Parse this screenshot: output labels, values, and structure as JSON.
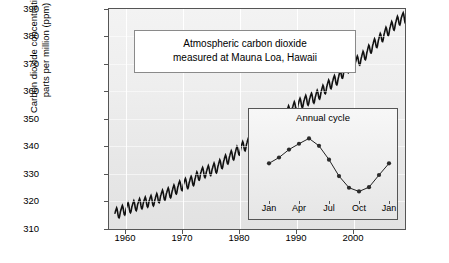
{
  "chart_data": {
    "type": "line",
    "title": "",
    "annotation": "Atmospheric carbon dioxide\nmeasured at Mauna Loa, Hawaii",
    "ylabel": "Carbon dioxide concentration,\nparts per million (ppm)",
    "xlabel": "",
    "ylim": [
      310,
      390
    ],
    "xlim": [
      1957,
      2009
    ],
    "yticks": [
      310,
      320,
      330,
      340,
      350,
      360,
      370,
      380,
      390
    ],
    "xticks": [
      1960,
      1970,
      1980,
      1990,
      2000
    ],
    "grid": true,
    "legend": null,
    "series": [
      {
        "name": "Mauna Loa monthly mean CO2 (ppm)",
        "x": [
          1958,
          1959,
          1960,
          1961,
          1962,
          1963,
          1964,
          1965,
          1966,
          1967,
          1968,
          1969,
          1970,
          1971,
          1972,
          1973,
          1974,
          1975,
          1976,
          1977,
          1978,
          1979,
          1980,
          1981,
          1982,
          1983,
          1984,
          1985,
          1986,
          1987,
          1988,
          1989,
          1990,
          1991,
          1992,
          1993,
          1994,
          1995,
          1996,
          1997,
          1998,
          1999,
          2000,
          2001,
          2002,
          2003,
          2004,
          2005,
          2006,
          2007,
          2008
        ],
        "values": [
          315.0,
          315.8,
          316.9,
          317.6,
          318.4,
          319.0,
          319.6,
          320.0,
          321.4,
          322.2,
          323.0,
          324.6,
          325.7,
          326.3,
          327.5,
          329.7,
          330.2,
          331.1,
          332.0,
          333.8,
          335.4,
          336.8,
          338.7,
          340.1,
          341.4,
          343.0,
          344.6,
          346.0,
          347.4,
          349.2,
          351.6,
          353.1,
          354.4,
          355.6,
          356.4,
          357.1,
          358.8,
          360.8,
          362.6,
          363.8,
          366.6,
          368.3,
          369.5,
          371.0,
          373.1,
          375.6,
          377.4,
          379.7,
          381.8,
          383.7,
          385.6
        ]
      }
    ],
    "inset": {
      "title": "Annual cycle",
      "type": "line",
      "xticks": [
        "Jan",
        "Apr",
        "Jul",
        "Oct",
        "Jan"
      ],
      "categories": [
        "Jan",
        "Feb",
        "Mar",
        "Apr",
        "May",
        "Jun",
        "Jul",
        "Aug",
        "Sep",
        "Oct",
        "Nov",
        "Dec",
        "Jan"
      ],
      "values": [
        1.55,
        2.1,
        2.85,
        3.4,
        3.9,
        3.2,
        1.9,
        0.35,
        -0.75,
        -1.1,
        -0.7,
        0.45,
        1.55
      ],
      "ylabel": "",
      "xlabel": ""
    }
  },
  "axes": {
    "y_title": "Carbon dioxide concentration,\nparts per million (ppm)",
    "y_labels": [
      "390",
      "380",
      "370",
      "360",
      "350",
      "340",
      "330",
      "320",
      "310"
    ],
    "x_labels": [
      "1960",
      "1970",
      "1980",
      "1990",
      "2000"
    ]
  },
  "annotation": {
    "line1": "Atmospheric carbon dioxide",
    "line2": "measured at Mauna Loa, Hawaii"
  },
  "inset": {
    "title": "Annual cycle",
    "x_labels": [
      "Jan",
      "Apr",
      "Jul",
      "Oct",
      "Jan"
    ]
  },
  "colors": {
    "curve": "#111111",
    "plot_background": "#eeeeee",
    "frame": "#555555",
    "grid": "#ffffff"
  }
}
